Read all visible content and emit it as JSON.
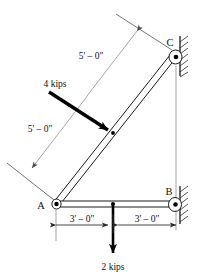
{
  "figure": {
    "type": "structural-frame-diagram",
    "title": "",
    "background_color": "#ffffff",
    "line_color": "#1a1a1a",
    "dimension_color": "#7d7d7d"
  },
  "joints": [
    {
      "id": "A",
      "label": "A",
      "support": "pin",
      "x": 55,
      "y": 205
    },
    {
      "id": "B",
      "label": "B",
      "support": "pin",
      "x": 172,
      "y": 205
    },
    {
      "id": "C",
      "label": "C",
      "support": "pin",
      "x": 175,
      "y": 55
    }
  ],
  "members": [
    {
      "id": "AC",
      "from": "A",
      "to": "C",
      "style": "double-line"
    },
    {
      "id": "AB",
      "from": "A",
      "to": "B",
      "style": "double-line"
    }
  ],
  "loads": [
    {
      "id": "load-4kips",
      "label": "4 kips",
      "magnitude": 4,
      "units": "kips",
      "direction": "perpendicular-to-member-AC",
      "applied_at": "midpoint-of-AC"
    },
    {
      "id": "load-2kips",
      "label": "2 kips",
      "magnitude": 2,
      "units": "kips",
      "direction": "downward",
      "applied_at": "midpoint-of-AB"
    }
  ],
  "dimensions": [
    {
      "id": "dim-ac-upper",
      "label": "5' – 0\"",
      "value": "5'-0\"",
      "along": "member-AC",
      "segment": "upper-half"
    },
    {
      "id": "dim-ac-lower",
      "label": "5' – 0\"",
      "value": "5'-0\"",
      "along": "member-AC",
      "segment": "lower-half"
    },
    {
      "id": "dim-ab-left",
      "label": "3' – 0\"",
      "value": "3'-0\"",
      "along": "member-AB",
      "segment": "left-half"
    },
    {
      "id": "dim-ab-right",
      "label": "3' – 0\"",
      "value": "3'-0\"",
      "along": "member-AB",
      "segment": "right-half"
    }
  ],
  "labels": {
    "joint_a": "A",
    "joint_b": "B",
    "joint_c": "C",
    "load_4kips": "4 kips",
    "load_2kips": "2 kips",
    "dim_5ft_upper": "5' – 0\"",
    "dim_5ft_lower": "5' – 0\"",
    "dim_3ft_left": "3' – 0\"",
    "dim_3ft_right": "3' – 0\""
  }
}
